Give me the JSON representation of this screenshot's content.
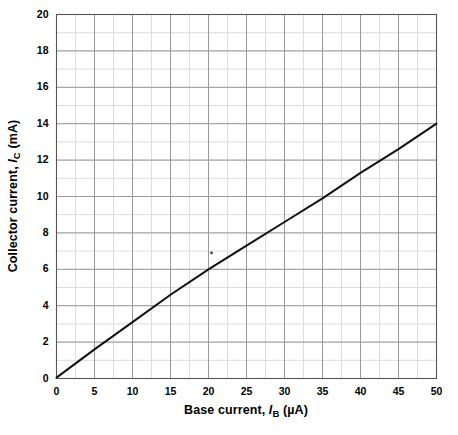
{
  "chart_data": {
    "type": "line",
    "title": "",
    "xlabel_parts": {
      "pre": "Base current, ",
      "symbol": "I",
      "sub": "B",
      "post": " (µA)"
    },
    "ylabel_parts": {
      "pre": "Collector current, ",
      "symbol": "I",
      "sub": "C",
      "post": " (mA)"
    },
    "xlabel": "Base current, I_B (µA)",
    "ylabel": "Collector current, I_C (mA)",
    "xlim": [
      0,
      50
    ],
    "ylim": [
      0,
      20
    ],
    "xticks": [
      0,
      5,
      10,
      15,
      20,
      25,
      30,
      35,
      40,
      45,
      50
    ],
    "yticks": [
      0,
      2,
      4,
      6,
      8,
      10,
      12,
      14,
      16,
      18,
      20
    ],
    "xtick_labels": [
      "0",
      "5",
      "10",
      "15",
      "20",
      "25",
      "30",
      "35",
      "40",
      "45",
      "50"
    ],
    "ytick_labels": [
      "0",
      "2",
      "4",
      "6",
      "8",
      "10",
      "12",
      "14",
      "16",
      "18",
      "20"
    ],
    "x_minor_step": 2.5,
    "y_minor_step": 1,
    "grid": true,
    "grid_major_color": "#999999",
    "grid_minor_color": "#dddddd",
    "axis_color": "#555555",
    "legend": null,
    "series": [
      {
        "name": "Collector current vs base current",
        "color": "#111111",
        "line_width": 2,
        "x": [
          0,
          5,
          10,
          15,
          20,
          25,
          30,
          35,
          40,
          45,
          50
        ],
        "y": [
          0.05,
          1.6,
          3.1,
          4.6,
          6.0,
          7.3,
          8.6,
          9.9,
          11.3,
          12.6,
          14.0
        ]
      }
    ],
    "annotations": [
      {
        "name": "stray-dot",
        "x": 20.4,
        "y": 6.9,
        "kind": "dot"
      }
    ]
  }
}
